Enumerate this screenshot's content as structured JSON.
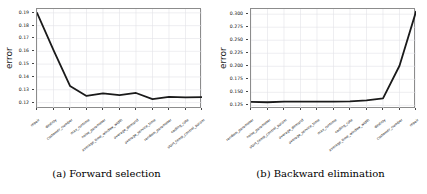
{
  "figure": {
    "panels": [
      {
        "id": "forward-selection",
        "caption": "(a) Forward selection",
        "ylabel": "error"
      },
      {
        "id": "backward-elimination",
        "caption": "(b) Backward elimination",
        "ylabel": "error"
      }
    ]
  },
  "chart_data": [
    {
      "type": "line",
      "title": "(a) Forward selection",
      "xlabel": "",
      "ylabel": "error",
      "grid": true,
      "legend": false,
      "ylim": [
        0.115,
        0.193
      ],
      "yticks": [
        "0.19",
        "0.18",
        "0.17",
        "0.16",
        "0.15",
        "0.14",
        "0.13",
        "0.12"
      ],
      "ytickvalues": [
        0.19,
        0.18,
        0.17,
        0.16,
        0.15,
        0.14,
        0.13,
        0.12
      ],
      "categories": [
        "repair",
        "destroy",
        "customer_number",
        "max_runtime",
        "noise_parameter",
        "average_time_window_width",
        "average_demand",
        "average_service_time",
        "random_parameter",
        "cooling_rate",
        "start_temp_control_param"
      ],
      "values": [
        0.19,
        0.161,
        0.133,
        0.1252,
        0.1272,
        0.1258,
        0.1275,
        0.1227,
        0.1245,
        0.124,
        0.1243
      ]
    },
    {
      "type": "line",
      "title": "(b) Backward elimination",
      "xlabel": "",
      "ylabel": "error",
      "grid": true,
      "legend": false,
      "ylim": [
        0.118,
        0.31
      ],
      "yticks": [
        "0.300",
        "0.275",
        "0.250",
        "0.225",
        "0.200",
        "0.175",
        "0.150",
        "0.125"
      ],
      "ytickvalues": [
        0.3,
        0.275,
        0.25,
        0.225,
        0.2,
        0.175,
        0.15,
        0.125
      ],
      "categories": [
        "random_parameter",
        "noise_parameter",
        "start_temp_control_param",
        "average_demand",
        "average_service_time",
        "max_runtime",
        "cooling_rate",
        "average_time_window_width",
        "destroy",
        "customer_number",
        "repair"
      ],
      "values": [
        0.1315,
        0.131,
        0.132,
        0.132,
        0.1322,
        0.132,
        0.1325,
        0.1345,
        0.1385,
        0.201,
        0.305
      ]
    }
  ]
}
